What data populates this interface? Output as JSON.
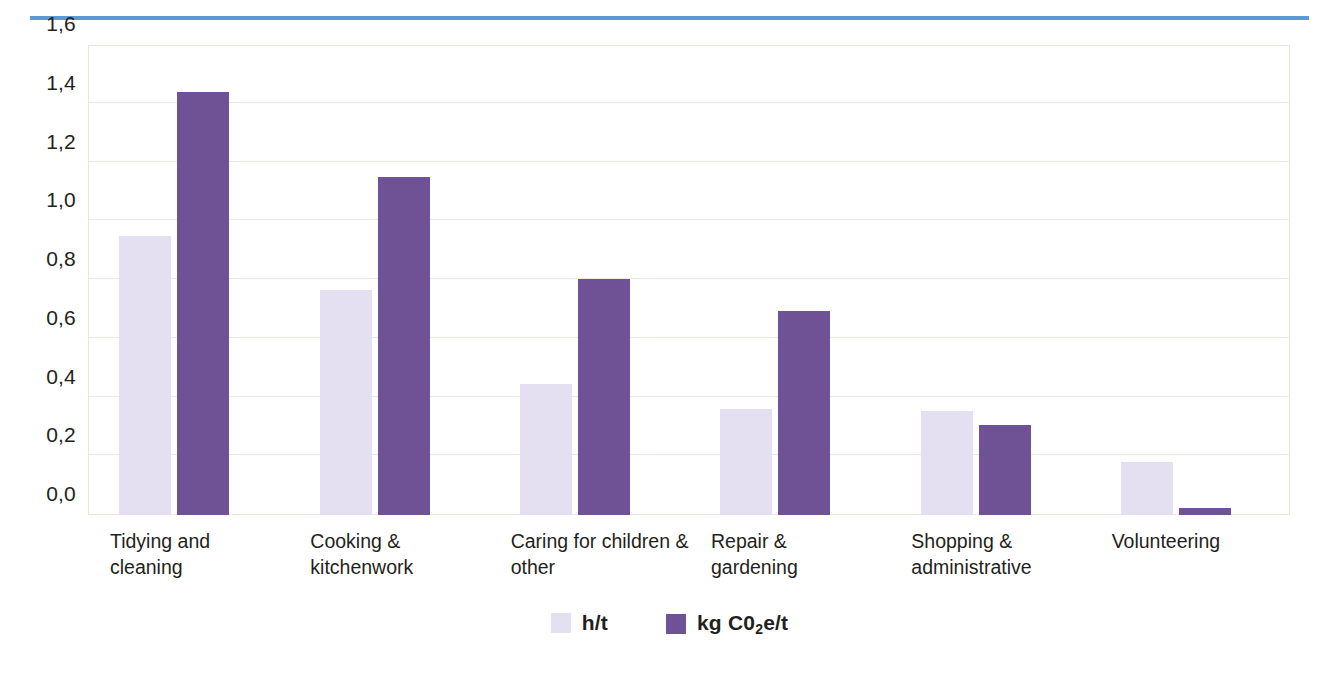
{
  "decor": {
    "top_rule_color": "#5b9bd5"
  },
  "chart_data": {
    "type": "bar",
    "title": "",
    "subtitle": "",
    "xlabel": "",
    "ylabel": "",
    "ylim": [
      0.0,
      1.6
    ],
    "ytick_labels": [
      "1,6",
      "1,4",
      "1,2",
      "1,0",
      "0,8",
      "0,6",
      "0,4",
      "0,2",
      "0,0"
    ],
    "ytick_values": [
      1.6,
      1.4,
      1.2,
      1.0,
      0.8,
      0.6,
      0.4,
      0.2,
      0.0
    ],
    "decimal_separator": ",",
    "grid": true,
    "legend_position": "bottom",
    "categories": [
      "Tidying and\ncleaning",
      "Cooking &\nkitchenwork",
      "Caring for children &\nother",
      "Repair &\ngardening",
      "Shopping &\nadministrative",
      "Volunteering"
    ],
    "series": [
      {
        "name": "h/t",
        "color": "#e4e0f1",
        "values": [
          0.95,
          0.765,
          0.445,
          0.36,
          0.355,
          0.18
        ]
      },
      {
        "name": "kg C0₂e/t",
        "color": "#6f5296",
        "values": [
          1.44,
          1.15,
          0.805,
          0.695,
          0.305,
          0.025
        ]
      }
    ]
  },
  "legend": {
    "items": [
      {
        "label_main": "h/t",
        "label_sub": "",
        "label_tail": "",
        "color": "#e4e0f1"
      },
      {
        "label_main": "kg C0",
        "label_sub": "2",
        "label_tail": "e/t",
        "color": "#6f5296"
      }
    ]
  }
}
